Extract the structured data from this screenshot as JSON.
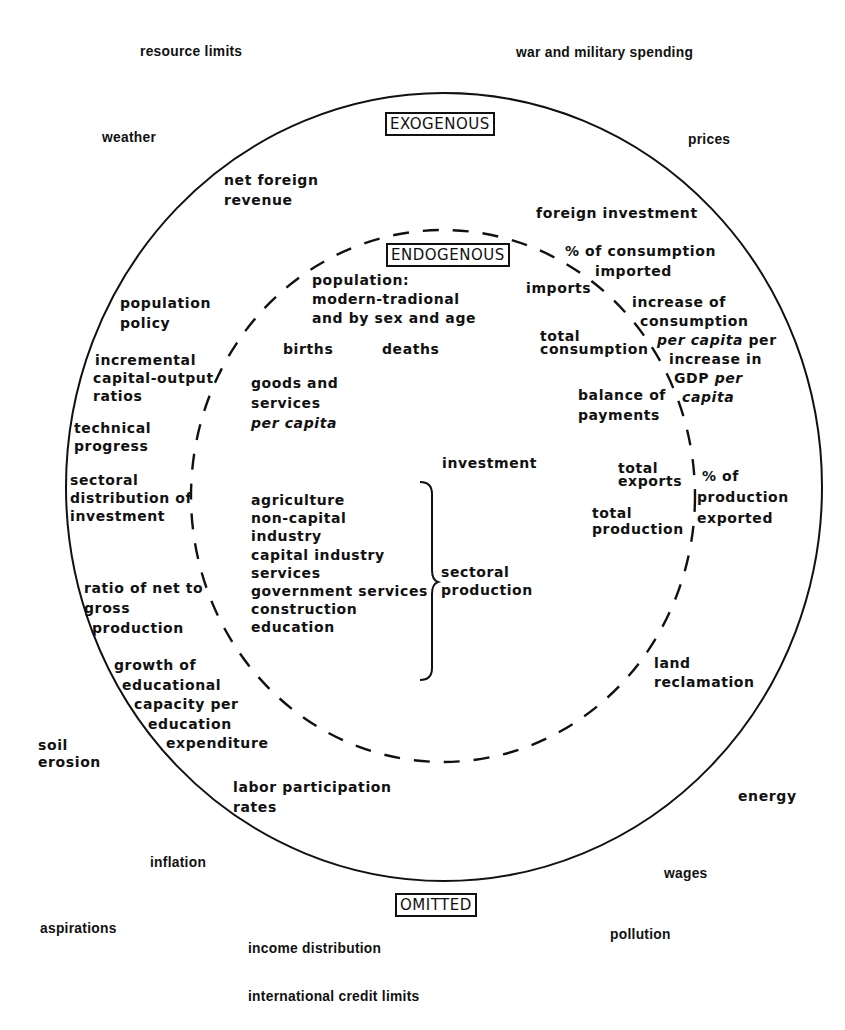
{
  "categories": {
    "exogenous": "EXOGENOUS",
    "endogenous": "ENDOGENOUS",
    "omitted": "OMITTED"
  },
  "omitted_factors": {
    "resource_limits": "resource limits",
    "war": "war and military spending",
    "weather": "weather",
    "prices": "prices",
    "soil_erosion_1": "soil",
    "soil_erosion_2": "erosion",
    "energy": "energy",
    "inflation": "inflation",
    "wages": "wages",
    "aspirations": "aspirations",
    "pollution": "pollution",
    "income_distribution": "income distribution",
    "credit_limits": "international credit limits"
  },
  "exogenous_factors": {
    "net_foreign_revenue": [
      "net foreign",
      "revenue"
    ],
    "foreign_investment": "foreign investment",
    "pct_consumption_imported": [
      "% of consumption",
      "imported"
    ],
    "increase_consumption": [
      "increase of",
      "consumption"
    ],
    "increase_consumption_percap": "per capita",
    "increase_consumption_per": " per",
    "increase_in": "increase in",
    "gdp": "GDP ",
    "gdp_per": "per",
    "gdp_capita": "capita",
    "population_policy": [
      "population",
      "policy"
    ],
    "icor": [
      "incremental",
      "capital-output",
      "ratios"
    ],
    "technical_progress": [
      "technical",
      "progress"
    ],
    "sectoral_distribution": [
      "sectoral",
      "distribution of",
      "investment"
    ],
    "pct_production_exported": [
      "% of",
      "production",
      "exported"
    ],
    "ratio_net_gross": [
      "ratio of net to",
      "gross",
      "production"
    ],
    "educational_growth": [
      "growth of",
      "educational",
      "capacity per",
      "education",
      "expenditure"
    ],
    "land_reclamation": [
      "land",
      "reclamation"
    ],
    "labor_participation": [
      "labor participation",
      "rates"
    ]
  },
  "endogenous_variables": {
    "population": [
      "population:",
      "modern-tradional",
      "and by sex and age"
    ],
    "births": "births",
    "deaths": "deaths",
    "goods_services": [
      "goods and",
      "services"
    ],
    "goods_services_percap": "per capita",
    "imports": "imports",
    "total_consumption": [
      "total",
      "consumption"
    ],
    "balance_of_payments": [
      "balance of",
      "payments"
    ],
    "investment": "investment",
    "total_exports": [
      "total",
      "exports"
    ],
    "total_production": [
      "total",
      "production"
    ],
    "sectors": [
      "agriculture",
      "non-capital",
      "industry",
      "capital industry",
      "services",
      "government services",
      "construction",
      "education"
    ],
    "sectoral_production": [
      "sectoral",
      "production"
    ]
  }
}
